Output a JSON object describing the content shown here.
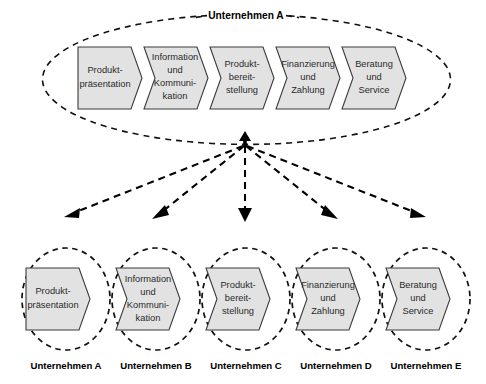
{
  "diagram": {
    "title_top": "Unternehmen A",
    "top_group": {
      "label": "Unternehmen A",
      "stages": [
        {
          "id": "produktpraesentation",
          "lines": [
            "Produkt-",
            "präsentation"
          ]
        },
        {
          "id": "information-kommunikation",
          "lines": [
            "Information",
            "und",
            "Kommuni-",
            "kation"
          ]
        },
        {
          "id": "produktbereitstellung",
          "lines": [
            "Produkt-",
            "bereit-",
            "stellung"
          ]
        },
        {
          "id": "finanzierung-zahlung",
          "lines": [
            "Finanzierung",
            "und",
            "Zahlung"
          ]
        },
        {
          "id": "beratung-service",
          "lines": [
            "Beratung",
            "und",
            "Service"
          ]
        }
      ]
    },
    "bottom_nodes": [
      {
        "id": "node-a",
        "caption": "Unternehmen A",
        "stage_lines": [
          "Produkt-",
          "präsentation"
        ]
      },
      {
        "id": "node-b",
        "caption": "Unternehmen B",
        "stage_lines": [
          "Information",
          "und",
          "Kommuni-",
          "kation"
        ]
      },
      {
        "id": "node-c",
        "caption": "Unternehmen C",
        "stage_lines": [
          "Produkt-",
          "bereit-",
          "stellung"
        ]
      },
      {
        "id": "node-d",
        "caption": "Unternehmen D",
        "stage_lines": [
          "Finanzierung",
          "und",
          "Zahlung"
        ]
      },
      {
        "id": "node-e",
        "caption": "Unternehmen E",
        "stage_lines": [
          "Beratung",
          "und",
          "Service"
        ]
      }
    ],
    "colors": {
      "shape_fill": "#e2e2e2",
      "shape_stroke": "#3b3b3b",
      "dashed_stroke": "#111111",
      "text": "#2a2a2a",
      "caption_text": "#000000",
      "background": "#ffffff"
    }
  }
}
